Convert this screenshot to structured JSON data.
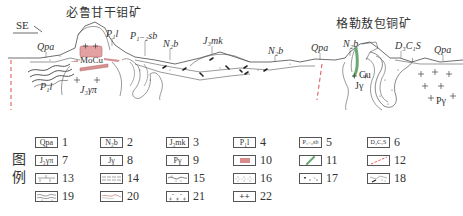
{
  "section": {
    "direction": "SE",
    "deposits": [
      {
        "name": "必鲁甘干钼矿",
        "x": 90,
        "y": 10
      },
      {
        "name": "格勒敖包铜矿",
        "x": 335,
        "y": 20
      }
    ],
    "labels": [
      {
        "id": "qpa-1",
        "text": "Qpa",
        "x": 37,
        "y": 45
      },
      {
        "id": "p1l-top",
        "text": "P₁l",
        "x": 108,
        "y": 30
      },
      {
        "id": "p12sb",
        "text": "P₁₋₂sb",
        "x": 132,
        "y": 32
      },
      {
        "id": "n2b-1",
        "text": "N₂b",
        "x": 163,
        "y": 40
      },
      {
        "id": "j3mk",
        "text": "J₃mk",
        "x": 203,
        "y": 37
      },
      {
        "id": "n2b-2",
        "text": "N₂b",
        "x": 268,
        "y": 47
      },
      {
        "id": "qpa-2",
        "text": "Qpa",
        "x": 312,
        "y": 44
      },
      {
        "id": "n2b-3",
        "text": "N₂b",
        "x": 343,
        "y": 40
      },
      {
        "id": "dcs",
        "text": "D₃C₁S",
        "x": 395,
        "y": 42
      },
      {
        "id": "qpa-3",
        "text": "Qpa",
        "x": 435,
        "y": 46
      },
      {
        "id": "moci",
        "text": "MoCu",
        "x": 80,
        "y": 56
      },
      {
        "id": "p1l-low",
        "text": "P₁l",
        "x": 40,
        "y": 83
      },
      {
        "id": "j3ypi",
        "text": "J₃γπ",
        "x": 80,
        "y": 85
      },
      {
        "id": "cu",
        "text": "Cu",
        "x": 360,
        "y": 70
      },
      {
        "id": "jy",
        "text": "Jγ",
        "x": 355,
        "y": 80
      },
      {
        "id": "py",
        "text": "Pγ",
        "x": 436,
        "y": 97
      }
    ],
    "colors": {
      "line": "#4a4a4a",
      "ore_body": "#d98c8c",
      "ore_fill": "#e8a5a5",
      "cu_vein": "#6aaa72",
      "fault": "#e0504a"
    }
  },
  "legend": {
    "title_chars": [
      "图",
      "例"
    ],
    "items": [
      {
        "num": "1",
        "symbol": "Qpa",
        "pattern": "text"
      },
      {
        "num": "2",
        "symbol": "N₂b",
        "pattern": "text"
      },
      {
        "num": "3",
        "symbol": "J₃mk",
        "pattern": "text"
      },
      {
        "num": "4",
        "symbol": "P₁l",
        "pattern": "text"
      },
      {
        "num": "5",
        "symbol": "P₁₋₂sb",
        "pattern": "text-hatch"
      },
      {
        "num": "6",
        "symbol": "D₃C₁S",
        "pattern": "text-dotted"
      },
      {
        "num": "7",
        "symbol": "J₃γπ",
        "pattern": "text"
      },
      {
        "num": "8",
        "symbol": "Jγ",
        "pattern": "text"
      },
      {
        "num": "9",
        "symbol": "Pγ",
        "pattern": "text"
      },
      {
        "num": "10",
        "symbol": "",
        "pattern": "ore-body"
      },
      {
        "num": "11",
        "symbol": "",
        "pattern": "cu-vein"
      },
      {
        "num": "12",
        "symbol": "",
        "pattern": "fault"
      },
      {
        "num": "13",
        "symbol": "",
        "pattern": "dashes"
      },
      {
        "num": "14",
        "symbol": "",
        "pattern": "horizontal-lines"
      },
      {
        "num": "15",
        "symbol": "",
        "pattern": "wavy-dots"
      },
      {
        "num": "16",
        "symbol": "",
        "pattern": "dots"
      },
      {
        "num": "17",
        "symbol": "",
        "pattern": "sparse-ticks"
      },
      {
        "num": "18",
        "symbol": "",
        "pattern": "breccia"
      },
      {
        "num": "19",
        "symbol": "",
        "pattern": "wavy-dots-2"
      },
      {
        "num": "20",
        "symbol": "",
        "pattern": "wavy-red"
      },
      {
        "num": "21",
        "symbol": "",
        "pattern": "dot-cross"
      },
      {
        "num": "22",
        "symbol": "++",
        "pattern": "crosses"
      }
    ]
  }
}
